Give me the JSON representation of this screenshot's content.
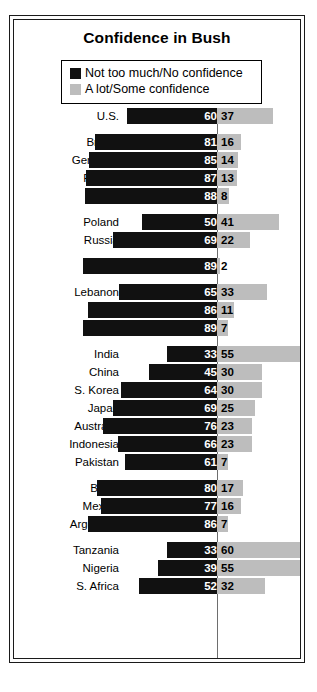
{
  "chart": {
    "title": "Confidence in Bush",
    "source": "2008 Pew Global Attitudes Project",
    "legend": [
      {
        "label": "Not too much/No confidence",
        "color": "#111111",
        "key": "no_confidence"
      },
      {
        "label": "A lot/Some confidence",
        "color": "#bdbdbd",
        "key": "some_confidence"
      }
    ]
  },
  "colors": {
    "negative_bar": "#111111",
    "positive_bar": "#bdbdbd",
    "axis": "#6e6e6e",
    "frame": "#1a1a1a",
    "background": "#ffffff",
    "negative_value_text": "#ffffff",
    "positive_value_text": "#000000"
  },
  "chart_data": {
    "type": "bar",
    "title": "Confidence in Bush",
    "subtitle": "",
    "xlabel": "",
    "ylabel": "",
    "orientation": "horizontal",
    "layout": "diverging",
    "grid": false,
    "legend_position": "top",
    "xlim": [
      -100,
      100
    ],
    "axis_center": 0,
    "units": "percent",
    "categories": [
      "U.S.",
      "Britain",
      "Germany",
      "France",
      "Spain",
      "Poland",
      "Russia",
      "Turkey",
      "Lebanon",
      "Egypt",
      "Jordan",
      "India",
      "China",
      "S. Korea",
      "Japan",
      "Australia",
      "Indonesia",
      "Pakistan",
      "Brazil",
      "Mexico",
      "Argentina",
      "Tanzania",
      "Nigeria",
      "S. Africa"
    ],
    "series": [
      {
        "name": "Not too much/No confidence",
        "color": "#111111",
        "direction": "left",
        "values": [
          60,
          81,
          85,
          87,
          88,
          50,
          69,
          89,
          65,
          86,
          89,
          33,
          45,
          64,
          69,
          76,
          66,
          61,
          80,
          77,
          86,
          33,
          39,
          52
        ]
      },
      {
        "name": "A lot/Some confidence",
        "color": "#bdbdbd",
        "direction": "right",
        "values": [
          37,
          16,
          14,
          13,
          8,
          41,
          22,
          2,
          33,
          11,
          7,
          55,
          30,
          30,
          25,
          23,
          23,
          7,
          17,
          16,
          7,
          60,
          55,
          32
        ]
      }
    ],
    "groups": [
      {
        "name": "united-states",
        "rows": [
          {
            "label": "U.S.",
            "no_confidence": 60,
            "some_confidence": 37
          }
        ]
      },
      {
        "name": "western-europe",
        "rows": [
          {
            "label": "Britain",
            "no_confidence": 81,
            "some_confidence": 16
          },
          {
            "label": "Germany",
            "no_confidence": 85,
            "some_confidence": 14
          },
          {
            "label": "France",
            "no_confidence": 87,
            "some_confidence": 13
          },
          {
            "label": "Spain",
            "no_confidence": 88,
            "some_confidence": 8
          }
        ]
      },
      {
        "name": "eastern-europe",
        "rows": [
          {
            "label": "Poland",
            "no_confidence": 50,
            "some_confidence": 41
          },
          {
            "label": "Russia",
            "no_confidence": 69,
            "some_confidence": 22
          }
        ]
      },
      {
        "name": "turkey",
        "rows": [
          {
            "label": "Turkey",
            "no_confidence": 89,
            "some_confidence": 2
          }
        ]
      },
      {
        "name": "middle-east",
        "rows": [
          {
            "label": "Lebanon",
            "no_confidence": 65,
            "some_confidence": 33
          },
          {
            "label": "Egypt",
            "no_confidence": 86,
            "some_confidence": 11
          },
          {
            "label": "Jordan",
            "no_confidence": 89,
            "some_confidence": 7
          }
        ]
      },
      {
        "name": "asia",
        "rows": [
          {
            "label": "India",
            "no_confidence": 33,
            "some_confidence": 55
          },
          {
            "label": "China",
            "no_confidence": 45,
            "some_confidence": 30
          },
          {
            "label": "S. Korea",
            "no_confidence": 64,
            "some_confidence": 30
          },
          {
            "label": "Japan",
            "no_confidence": 69,
            "some_confidence": 25
          },
          {
            "label": "Australia",
            "no_confidence": 76,
            "some_confidence": 23
          },
          {
            "label": "Indonesia",
            "no_confidence": 66,
            "some_confidence": 23
          },
          {
            "label": "Pakistan",
            "no_confidence": 61,
            "some_confidence": 7
          }
        ]
      },
      {
        "name": "latin-america",
        "rows": [
          {
            "label": "Brazil",
            "no_confidence": 80,
            "some_confidence": 17
          },
          {
            "label": "Mexico",
            "no_confidence": 77,
            "some_confidence": 16
          },
          {
            "label": "Argentina",
            "no_confidence": 86,
            "some_confidence": 7
          }
        ]
      },
      {
        "name": "africa",
        "rows": [
          {
            "label": "Tanzania",
            "no_confidence": 33,
            "some_confidence": 60
          },
          {
            "label": "Nigeria",
            "no_confidence": 39,
            "some_confidence": 55
          },
          {
            "label": "S. Africa",
            "no_confidence": 52,
            "some_confidence": 32
          }
        ]
      }
    ]
  }
}
